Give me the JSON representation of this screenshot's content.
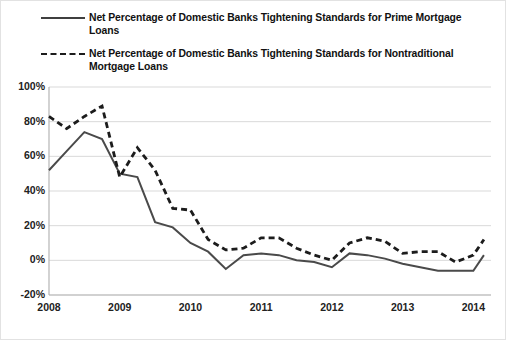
{
  "legend": {
    "items": [
      {
        "style": "solid",
        "label": "Net Percentage of Domestic Banks Tightening Standards for Prime Mortgage Loans"
      },
      {
        "style": "dashed",
        "label": "Net Percentage of Domestic Banks Tightening Standards for Nontraditional Mortgage Loans"
      }
    ]
  },
  "chart_data": {
    "type": "line",
    "title": "",
    "xlabel": "",
    "ylabel": "",
    "ylim": [
      -20,
      100
    ],
    "xlim": [
      2008,
      2014.25
    ],
    "grid": true,
    "legend_position": "top",
    "ytick_labels": [
      "100%",
      "80%",
      "60%",
      "40%",
      "20%",
      "0%",
      "-20%"
    ],
    "ytick_values": [
      100,
      80,
      60,
      40,
      20,
      0,
      -20
    ],
    "xtick_labels": [
      "2008",
      "2009",
      "2010",
      "2011",
      "2012",
      "2013",
      "2014"
    ],
    "xtick_values": [
      2008,
      2009,
      2010,
      2011,
      2012,
      2013,
      2014
    ],
    "colors": {
      "prime": "#4a4a4a",
      "nontraditional": "#1c1c1c",
      "grid": "#d9d9d9",
      "axis": "#b5b5b5"
    },
    "series": [
      {
        "name": "Net Percentage of Domestic Banks Tightening Standards for Prime Mortgage Loans",
        "style": "solid",
        "x": [
          2008.0,
          2008.25,
          2008.5,
          2008.75,
          2009.0,
          2009.25,
          2009.5,
          2009.75,
          2010.0,
          2010.25,
          2010.5,
          2010.75,
          2011.0,
          2011.25,
          2011.5,
          2011.75,
          2012.0,
          2012.25,
          2012.5,
          2012.75,
          2013.0,
          2013.25,
          2013.5,
          2013.75,
          2014.0,
          2014.15
        ],
        "values": [
          52,
          63,
          74,
          70,
          50,
          48,
          22,
          19,
          10,
          5,
          -5,
          3,
          4,
          3,
          0,
          -1,
          -4,
          4,
          3,
          1,
          -2,
          -4,
          -6,
          -6,
          -6,
          3
        ]
      },
      {
        "name": "Net Percentage of Domestic Banks Tightening Standards for Nontraditional Mortgage Loans",
        "style": "dashed",
        "x": [
          2008.0,
          2008.25,
          2008.5,
          2008.75,
          2009.0,
          2009.25,
          2009.5,
          2009.75,
          2010.0,
          2010.25,
          2010.5,
          2010.75,
          2011.0,
          2011.25,
          2011.5,
          2011.75,
          2012.0,
          2012.25,
          2012.5,
          2012.75,
          2013.0,
          2013.25,
          2013.5,
          2013.75,
          2014.0,
          2014.15
        ],
        "values": [
          83,
          76,
          83,
          89,
          48,
          65,
          52,
          30,
          29,
          12,
          6,
          7,
          13,
          13,
          7,
          3,
          0,
          10,
          13,
          11,
          4,
          5,
          5,
          -1,
          3,
          12
        ]
      }
    ]
  }
}
